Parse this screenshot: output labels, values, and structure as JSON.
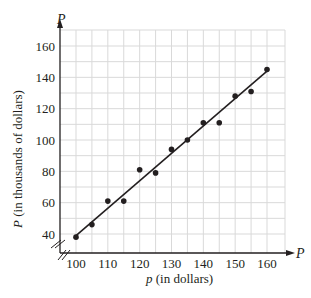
{
  "chart_data": {
    "type": "scatter",
    "title": "",
    "xlabel": "p (in dollars)",
    "ylabel": "P (in thousands of dollars)",
    "x_axis_var": "P",
    "y_axis_var": "P",
    "xlim": [
      100,
      162.5
    ],
    "ylim": [
      35,
      165
    ],
    "xticks": [
      100,
      110,
      120,
      130,
      140,
      150,
      160
    ],
    "yticks": [
      40,
      60,
      80,
      100,
      120,
      140,
      160
    ],
    "grid": true,
    "grid_x_step": 5,
    "grid_y_step": 10,
    "axis_breaks": true,
    "legend": null,
    "series": [
      {
        "name": "data",
        "x": [
          100,
          105,
          110,
          115,
          120,
          125,
          130,
          135,
          140,
          145,
          150,
          155,
          160
        ],
        "y": [
          38,
          46,
          61,
          61,
          81,
          79,
          94,
          100,
          111,
          111,
          128,
          131,
          145
        ]
      }
    ],
    "trendline": {
      "x": [
        100,
        160
      ],
      "y": [
        39,
        144
      ]
    },
    "colors": {
      "ink": "#231f20",
      "grid": "#d9d9d9"
    }
  },
  "labels": {
    "x_axis_var": "P",
    "y_axis_var": "P",
    "xlabel_var": "p",
    "xlabel_rest": " (in dollars)",
    "ylabel_var": "P",
    "ylabel_rest": " (in thousands of dollars)"
  }
}
